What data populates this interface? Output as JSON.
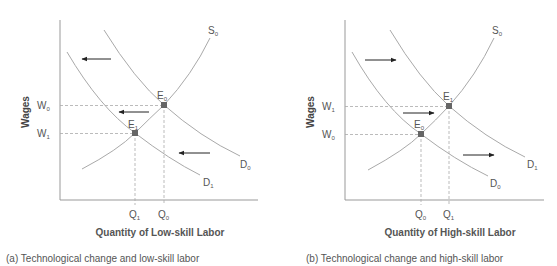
{
  "panels": [
    {
      "id": "a",
      "ylabel": "Wages",
      "xlabel": "Quantity of Low-skill Labor",
      "caption": "(a) Technological change and low-skill labor",
      "curves": {
        "supply": {
          "label": "S",
          "sub": "0"
        },
        "demand_upper": {
          "label": "D",
          "sub": "0"
        },
        "demand_lower": {
          "label": "D",
          "sub": "1"
        }
      },
      "points": {
        "upper": {
          "label": "E",
          "sub": "0"
        },
        "lower": {
          "label": "E",
          "sub": "1"
        }
      },
      "wage_ticks": {
        "upper": {
          "label": "W",
          "sub": "0"
        },
        "lower": {
          "label": "W",
          "sub": "1"
        }
      },
      "qty_ticks": {
        "left": {
          "label": "Q",
          "sub": "1"
        },
        "right": {
          "label": "Q",
          "sub": "0"
        }
      },
      "shift_direction": "left"
    },
    {
      "id": "b",
      "ylabel": "Wages",
      "xlabel": "Quantity of High-skill Labor",
      "caption": "(b) Technological change and high-skill labor",
      "curves": {
        "supply": {
          "label": "S",
          "sub": "0"
        },
        "demand_upper": {
          "label": "D",
          "sub": "1"
        },
        "demand_lower": {
          "label": "D",
          "sub": "0"
        }
      },
      "points": {
        "upper": {
          "label": "E",
          "sub": "1"
        },
        "lower": {
          "label": "E",
          "sub": "0"
        }
      },
      "wage_ticks": {
        "upper": {
          "label": "W",
          "sub": "1"
        },
        "lower": {
          "label": "W",
          "sub": "0"
        }
      },
      "qty_ticks": {
        "left": {
          "label": "Q",
          "sub": "0"
        },
        "right": {
          "label": "Q",
          "sub": "1"
        }
      },
      "shift_direction": "right"
    }
  ],
  "colors": {
    "curve": "#a9a9a9",
    "axis": "#999999",
    "point": "#666666",
    "arrow": "#222222",
    "text": "#555555"
  }
}
